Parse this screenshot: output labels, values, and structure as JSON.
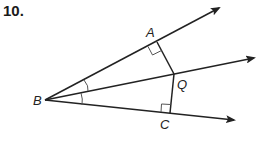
{
  "problem_number": "10.",
  "diagram": {
    "points": {
      "B": {
        "label": "B",
        "x": 45,
        "y": 100
      },
      "A": {
        "label": "A",
        "x": 157,
        "y": 42
      },
      "Q": {
        "label": "Q",
        "x": 174,
        "y": 74
      },
      "C": {
        "label": "C",
        "x": 170,
        "y": 113
      }
    },
    "rays": [
      {
        "name": "BA",
        "from": "B",
        "to": [
          219,
          8
        ]
      },
      {
        "name": "BQ",
        "from": "B",
        "to": [
          254,
          58
        ]
      },
      {
        "name": "BC",
        "from": "B",
        "to": [
          234,
          120
        ]
      }
    ],
    "segments": [
      {
        "name": "AQ",
        "from": "A",
        "to": "Q"
      },
      {
        "name": "CQ",
        "from": "C",
        "to": "Q"
      }
    ],
    "right_angles": [
      "A",
      "C"
    ],
    "congruent_angles": [
      "ABQ",
      "QBC"
    ],
    "stroke_color": "#222222"
  }
}
